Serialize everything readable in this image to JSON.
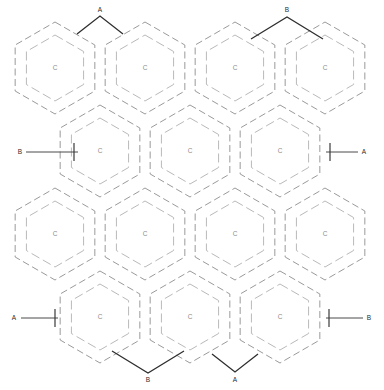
{
  "diagram": {
    "background_color": "#ffffff",
    "outline_color": "#9a9a9a",
    "inner_color": "#b9b9b9",
    "mark_color": "#2e2e2e",
    "cell_label_color": "#8d8d8d"
  },
  "geometry": {
    "hex_radius": 46,
    "hex_inner_radius": 33,
    "col_step": 90,
    "row_step": 68,
    "orientation": "pointy-top"
  },
  "cells": {
    "label": "C",
    "rows": [
      {
        "row": 1,
        "cy": 68,
        "centers_x": [
          55,
          145,
          235,
          325
        ]
      },
      {
        "row": 2,
        "cy": 151,
        "centers_x": [
          100,
          190,
          280
        ]
      },
      {
        "row": 3,
        "cy": 234,
        "centers_x": [
          55,
          145,
          235,
          325
        ]
      },
      {
        "row": 4,
        "cy": 317,
        "centers_x": [
          100,
          190,
          280
        ]
      }
    ]
  },
  "markers": [
    {
      "id": "top-a",
      "label": "A",
      "kind": "apex-up",
      "label_x": 100,
      "label_y": 10,
      "apex_x": 100,
      "apex_y": 16,
      "span": 23,
      "drop": 18
    },
    {
      "id": "top-b",
      "label": "B",
      "kind": "apex-up",
      "label_x": 287,
      "label_y": 10,
      "apex_x": 287,
      "apex_y": 17,
      "span": 36,
      "drop": 22
    },
    {
      "id": "left-b",
      "label": "B",
      "kind": "leader-right",
      "label_x": 20,
      "label_y": 152,
      "line_x1": 26,
      "line_x2": 78,
      "tick_x": 74,
      "tick_y1": 143,
      "tick_y2": 161
    },
    {
      "id": "right-a",
      "label": "A",
      "kind": "leader-left",
      "label_x": 364,
      "label_y": 152,
      "line_x1": 358,
      "line_x2": 326,
      "tick_x": 330,
      "tick_y1": 143,
      "tick_y2": 161
    },
    {
      "id": "bottom-left-a",
      "label": "A",
      "kind": "leader-right",
      "label_x": 14,
      "label_y": 318,
      "line_x1": 21,
      "line_x2": 58,
      "tick_x": 55,
      "tick_y1": 309,
      "tick_y2": 327
    },
    {
      "id": "bottom-right-b",
      "label": "B",
      "kind": "leader-left",
      "label_x": 369,
      "label_y": 318,
      "line_x1": 363,
      "line_x2": 326,
      "tick_x": 329,
      "tick_y1": 309,
      "tick_y2": 327
    },
    {
      "id": "bottom-b",
      "label": "B",
      "kind": "apex-down",
      "label_x": 148,
      "label_y": 380,
      "apex_x": 148,
      "apex_y": 373,
      "span": 36,
      "drop": 22
    },
    {
      "id": "bottom-a",
      "label": "A",
      "kind": "apex-down",
      "label_x": 235,
      "label_y": 380,
      "apex_x": 235,
      "apex_y": 372,
      "span": 23,
      "drop": 18
    }
  ]
}
